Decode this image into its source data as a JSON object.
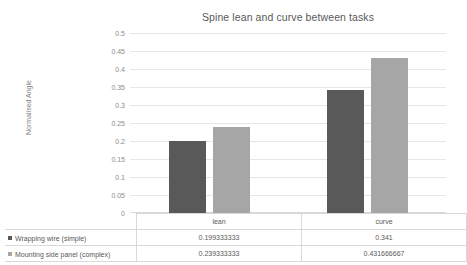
{
  "chart_data": {
    "type": "bar",
    "title": "Spine lean and curve between tasks",
    "xlabel": "",
    "ylabel": "Normalised Angle",
    "categories": [
      "lean",
      "curve"
    ],
    "series": [
      {
        "name": "Wrapping wire (simple)",
        "color": "#595959",
        "values": [
          0.199333333,
          0.341
        ],
        "value_labels": [
          "0.199333333",
          "0.341"
        ]
      },
      {
        "name": "Mounting side panel (complex)",
        "color": "#a6a6a6",
        "values": [
          0.239333333,
          0.431666667
        ],
        "value_labels": [
          "0.239333333",
          "0.431666667"
        ]
      }
    ],
    "ylim": [
      0,
      0.5
    ],
    "y_ticks": [
      0,
      0.05,
      0.1,
      0.15,
      0.2,
      0.25,
      0.3,
      0.35,
      0.4,
      0.45,
      0.5
    ],
    "y_tick_labels": [
      "0",
      "0.05",
      "0.1",
      "0.15",
      "0.2",
      "0.25",
      "0.3",
      "0.35",
      "0.4",
      "0.45",
      "0.5"
    ],
    "grid": true,
    "legend_position": "data-table",
    "has_data_table": true
  },
  "colors": {
    "background": "#ffffff",
    "gridline": "#e4e7ea",
    "text": "#595959",
    "tick_text": "#8c8c8c",
    "table_border": "#d9d9d9",
    "series_1": "#595959",
    "series_2": "#a6a6a6"
  }
}
